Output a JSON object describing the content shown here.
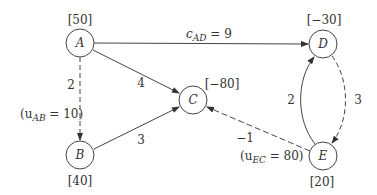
{
  "diagram": {
    "type": "network-flow",
    "nodes": [
      {
        "id": "A",
        "label": "A",
        "supply": "[50]"
      },
      {
        "id": "B",
        "label": "B",
        "supply": "[40]"
      },
      {
        "id": "C",
        "label": "C",
        "supply": "[−80]"
      },
      {
        "id": "D",
        "label": "D",
        "supply": "[−30]"
      },
      {
        "id": "E",
        "label": "E",
        "supply": "[20]"
      }
    ],
    "edges": [
      {
        "from": "A",
        "to": "D",
        "style": "solid",
        "cost_label": "c",
        "cost_sub": "AD",
        "cost_value": " = 9"
      },
      {
        "from": "A",
        "to": "C",
        "style": "solid",
        "cost": "4"
      },
      {
        "from": "A",
        "to": "B",
        "style": "dashed",
        "cost": "2",
        "capacity_open": "(u",
        "capacity_sub": "AB",
        "capacity_value": " = 10)"
      },
      {
        "from": "B",
        "to": "C",
        "style": "solid",
        "cost": "3"
      },
      {
        "from": "E",
        "to": "C",
        "style": "dashed",
        "cost": "−1",
        "capacity_open": "(u",
        "capacity_sub": "EC",
        "capacity_value": " = 80)"
      },
      {
        "from": "E",
        "to": "D",
        "style": "solid",
        "cost": "2"
      },
      {
        "from": "D",
        "to": "E",
        "style": "dashed",
        "cost": "3"
      }
    ]
  }
}
